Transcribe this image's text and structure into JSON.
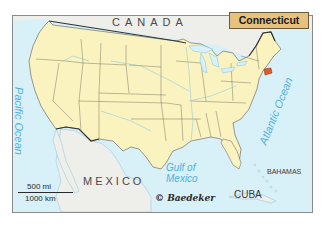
{
  "map": {
    "title": "Connecticut",
    "highlighted_state": "Connecticut",
    "highlight_color": "#e05a2a",
    "land_us_color": "#fbf3bf",
    "land_other_color": "#eeeeea",
    "water_color": "#d8f0f8",
    "labels": {
      "canada": "CANADA",
      "mexico": "MEXICO",
      "cuba": "CUBA",
      "bahamas": "BAHAMAS",
      "pacific": "Pacific Ocean",
      "atlantic": "Atlantic Ocean",
      "gulf_line1": "Gulf of",
      "gulf_line2": "Mexico"
    },
    "scale": {
      "miles": "500 mi",
      "km": "1000 km"
    },
    "copyright": "© Baedeker"
  }
}
